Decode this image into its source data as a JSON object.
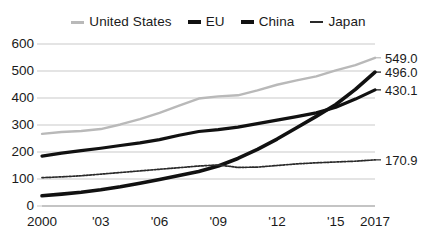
{
  "chart_data": {
    "type": "line",
    "title": "",
    "subtitle": "",
    "xlabel": "",
    "ylabel": "",
    "grid": true,
    "legend_position": "top-center",
    "xlim": [
      2000,
      2017
    ],
    "ylim": [
      0,
      600
    ],
    "yticks": [
      0,
      100,
      200,
      300,
      400,
      500,
      600
    ],
    "ytick_labels": [
      "0",
      "100",
      "200",
      "300",
      "400",
      "500",
      "600"
    ],
    "xticks": [
      2000,
      2003,
      2006,
      2009,
      2012,
      2015,
      2017
    ],
    "xtick_labels": [
      "2000",
      "'03",
      "'06",
      "'09",
      "'12",
      "'15",
      "2017"
    ],
    "x": [
      2000,
      2001,
      2002,
      2003,
      2004,
      2005,
      2006,
      2007,
      2008,
      2009,
      2010,
      2011,
      2012,
      2013,
      2014,
      2015,
      2016,
      2017
    ],
    "series": [
      {
        "name": "United States",
        "color": "#b9b9b9",
        "width": 2.4,
        "dash": "none",
        "end_label": "549.0",
        "end_value": 549.0,
        "values": [
          267,
          274,
          278,
          285,
          302,
          322,
          345,
          372,
          398,
          406,
          410,
          428,
          449,
          465,
          480,
          502,
          522,
          549
        ]
      },
      {
        "name": "EU",
        "color": "#111111",
        "width": 3.2,
        "dash": "none",
        "end_label": "430.1",
        "end_value": 430.1,
        "values": [
          185,
          196,
          205,
          214,
          224,
          234,
          246,
          262,
          276,
          283,
          292,
          305,
          318,
          331,
          345,
          366,
          396,
          430.1
        ]
      },
      {
        "name": "China",
        "color": "#111111",
        "width": 3.6,
        "dash": "none",
        "end_label": "496.0",
        "end_value": 496.0,
        "values": [
          38,
          44,
          51,
          60,
          71,
          84,
          98,
          113,
          128,
          148,
          176,
          210,
          248,
          290,
          332,
          376,
          432,
          496.0
        ]
      },
      {
        "name": "Japan",
        "color": "#2a2a2a",
        "width": 1.7,
        "dash": "2,1.4",
        "end_label": "170.9",
        "end_value": 170.9,
        "values": [
          105,
          108,
          112,
          118,
          124,
          130,
          136,
          142,
          148,
          152,
          143,
          144,
          150,
          156,
          160,
          163,
          166,
          170.9
        ]
      }
    ]
  },
  "legend": {
    "items": [
      {
        "label": "United States",
        "color": "#b9b9b9",
        "width": 3
      },
      {
        "label": "EU",
        "color": "#111111",
        "width": 4
      },
      {
        "label": "China",
        "color": "#111111",
        "width": 4
      },
      {
        "label": "Japan",
        "color": "#2a2a2a",
        "width": 2
      }
    ]
  },
  "axis": {
    "gridline_color": "#c9c9c9",
    "baseline_color": "#b0b0b0"
  }
}
